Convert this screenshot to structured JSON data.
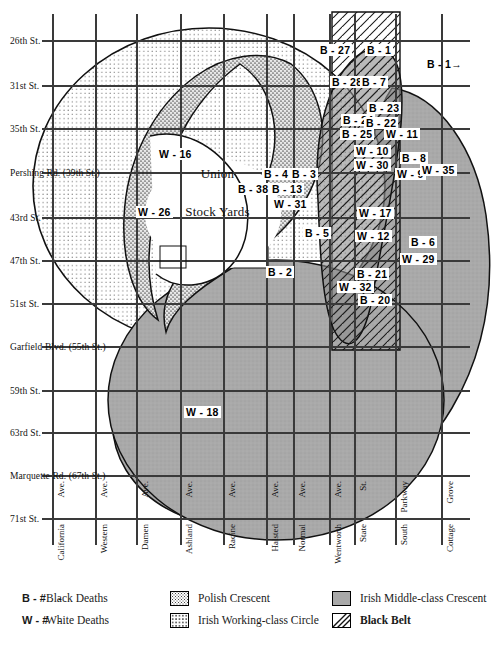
{
  "figure": {
    "center_label_line1": "Union",
    "center_label_line2": "Stock Yards"
  },
  "horizontal_streets": [
    {
      "label": "26th St.",
      "y": 36
    },
    {
      "label": "31st St.",
      "y": 81
    },
    {
      "label": "35th St.",
      "y": 124
    },
    {
      "label": "Pershing  Rd.   (39th St.)",
      "y": 168
    },
    {
      "label": "43rd St.",
      "y": 213
    },
    {
      "label": "47th St.",
      "y": 256
    },
    {
      "label": "51st St.",
      "y": 299
    },
    {
      "label": "Garfield  Blvd.   (55th St.)",
      "y": 342
    },
    {
      "label": "59th St.",
      "y": 386
    },
    {
      "label": "63rd St.",
      "y": 428
    },
    {
      "label": "Marquette  Rd.   (67th St.)",
      "y": 471
    },
    {
      "label": "71st St.",
      "y": 514
    }
  ],
  "vertical_streets": [
    {
      "name": "California",
      "suffix": "Ave.",
      "x": 53
    },
    {
      "name": "Western",
      "suffix": "Ave.",
      "x": 96
    },
    {
      "name": "Damen",
      "suffix": "Ave.",
      "x": 137
    },
    {
      "name": "Ashland",
      "suffix": "Ave.",
      "x": 181
    },
    {
      "name": "Racine",
      "suffix": "Ave.",
      "x": 224
    },
    {
      "name": "Halsted",
      "suffix": "Ave.",
      "x": 267
    },
    {
      "name": "Normal",
      "suffix": "Ave.",
      "x": 294
    },
    {
      "name": "Wentworth",
      "suffix": "Ave.",
      "x": 330
    },
    {
      "name": "State",
      "suffix": "St.",
      "x": 355
    },
    {
      "name": "South",
      "suffix": "Parkway",
      "x": 396
    },
    {
      "name": "Cottage",
      "suffix": "Grove",
      "x": 442
    }
  ],
  "cell_labels": [
    {
      "text": "B - 27",
      "x": 318,
      "y": 44
    },
    {
      "text": "B - 1",
      "x": 365,
      "y": 44
    },
    {
      "text": "B - 1→",
      "x": 425,
      "y": 58,
      "plain": true
    },
    {
      "text": "B - 28",
      "x": 330,
      "y": 76
    },
    {
      "text": "B - 7",
      "x": 360,
      "y": 76
    },
    {
      "text": "B - 23",
      "x": 367,
      "y": 102
    },
    {
      "text": "B - 24",
      "x": 341,
      "y": 114
    },
    {
      "text": "B - 22",
      "x": 364,
      "y": 117
    },
    {
      "text": "B - 25",
      "x": 340,
      "y": 128
    },
    {
      "text": "W - 11",
      "x": 384,
      "y": 128
    },
    {
      "text": "W - 10",
      "x": 354,
      "y": 145
    },
    {
      "text": "W - 30",
      "x": 354,
      "y": 159
    },
    {
      "text": "B - 8",
      "x": 400,
      "y": 152
    },
    {
      "text": "W - 9",
      "x": 395,
      "y": 168
    },
    {
      "text": "W - 35",
      "x": 420,
      "y": 164
    },
    {
      "text": "W - 16",
      "x": 157,
      "y": 148
    },
    {
      "text": "W - 26",
      "x": 136,
      "y": 206
    },
    {
      "text": "B - 4",
      "x": 262,
      "y": 168
    },
    {
      "text": "B - 3",
      "x": 290,
      "y": 168
    },
    {
      "text": "B - 38",
      "x": 236,
      "y": 183
    },
    {
      "text": "B - 13",
      "x": 270,
      "y": 183
    },
    {
      "text": "W - 31",
      "x": 272,
      "y": 198
    },
    {
      "text": "B - 5",
      "x": 303,
      "y": 227
    },
    {
      "text": "B - 2",
      "x": 266,
      "y": 266
    },
    {
      "text": "W - 17",
      "x": 357,
      "y": 207
    },
    {
      "text": "W - 12",
      "x": 355,
      "y": 230
    },
    {
      "text": "B - 6",
      "x": 409,
      "y": 236
    },
    {
      "text": "W - 29",
      "x": 400,
      "y": 253
    },
    {
      "text": "B - 21",
      "x": 355,
      "y": 268
    },
    {
      "text": "W - 32",
      "x": 337,
      "y": 281
    },
    {
      "text": "B - 20",
      "x": 358,
      "y": 294
    },
    {
      "text": "W - 18",
      "x": 184,
      "y": 406
    }
  ],
  "legend": {
    "items": [
      {
        "key": "B - # ",
        "dash": "- ",
        "label": "Black Deaths",
        "swatch": "none",
        "col": 0,
        "row": 0
      },
      {
        "key": "W - # ",
        "dash": "- ",
        "label": "White Deaths",
        "swatch": "none",
        "col": 0,
        "row": 1
      },
      {
        "key": "",
        "dash": "",
        "label": "Polish Crescent",
        "swatch": "polish",
        "col": 1,
        "row": 0
      },
      {
        "key": "",
        "dash": "",
        "label": "Irish Working-class Circle",
        "swatch": "irish-working",
        "col": 1,
        "row": 1
      },
      {
        "key": "",
        "dash": "",
        "label": "Irish Middle-class Crescent",
        "swatch": "irish-middle",
        "col": 2,
        "row": 0
      },
      {
        "key": "",
        "dash": "",
        "label": "Black Belt",
        "swatch": "black-belt",
        "col": 2,
        "row": 1,
        "bold": true
      }
    ]
  },
  "colors": {
    "grid": "#3a3a3a",
    "outline": "#111111",
    "irish_middle": "#a9a9a9",
    "polish_dot": "#4a4a4a",
    "irish_dot": "#6a6a6a",
    "paper": "#ffffff"
  }
}
